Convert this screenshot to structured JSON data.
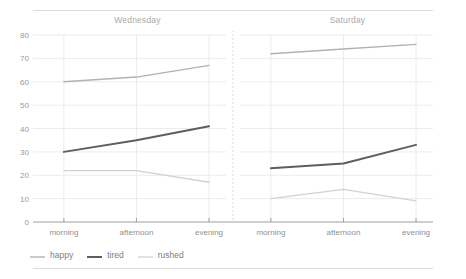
{
  "chart_data": {
    "type": "line",
    "title": "",
    "xlabel": "",
    "ylabel": "",
    "ylim": [
      0,
      80
    ],
    "yticks": [
      0,
      10,
      20,
      30,
      40,
      50,
      60,
      70,
      80
    ],
    "ytick_labels": [
      "0",
      "10",
      "20",
      "30",
      "40",
      "50",
      "60",
      "70",
      "80"
    ],
    "x": [
      "morning",
      "afternoon",
      "evening"
    ],
    "grid": true,
    "legend_position": "bottom-left",
    "facets": [
      {
        "label": "Wednesday",
        "series": [
          {
            "name": "happy",
            "values": [
              60,
              62,
              67
            ]
          },
          {
            "name": "tired",
            "values": [
              30,
              35,
              41
            ]
          },
          {
            "name": "rushed",
            "values": [
              22,
              22,
              17
            ]
          }
        ]
      },
      {
        "label": "Saturday",
        "series": [
          {
            "name": "happy",
            "values": [
              72,
              74,
              76
            ]
          },
          {
            "name": "tired",
            "values": [
              23,
              25,
              33
            ]
          },
          {
            "name": "rushed",
            "values": [
              10,
              14,
              9
            ]
          }
        ]
      }
    ],
    "legend": [
      {
        "label": "happy",
        "color": "#b2b2b2",
        "width": 1.4
      },
      {
        "label": "tired",
        "color": "#5e5e5e",
        "width": 2.0
      },
      {
        "label": "rushed",
        "color": "#d2d2d2",
        "width": 1.3
      }
    ],
    "colors": {
      "happy": "#b2b2b2",
      "tired": "#5e5e5e",
      "rushed": "#d2d2d2",
      "grid": "#ececec",
      "axis": "#9e9e9e",
      "divider": "#d8d8d8",
      "text": "#8f8f8f"
    }
  }
}
